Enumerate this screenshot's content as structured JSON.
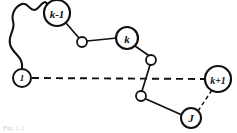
{
  "figure": {
    "caption": "Fig. 1.1",
    "stroke_color": "#111111",
    "fill_color": "#ffffff",
    "background_color": "#ffffff"
  },
  "nodes": [
    {
      "id": "node-1",
      "label": "1",
      "kind": "labeled",
      "x": 22,
      "y": 78,
      "r": 9,
      "font_size": 9
    },
    {
      "id": "node-k-minus-1",
      "label": "k-1",
      "kind": "labeled",
      "x": 57,
      "y": 13,
      "r": 13,
      "font_size": 11
    },
    {
      "id": "node-small-a",
      "label": "",
      "kind": "plain",
      "x": 82,
      "y": 42,
      "r": 5,
      "font_size": 0
    },
    {
      "id": "node-k",
      "label": "k",
      "kind": "labeled",
      "x": 127,
      "y": 38,
      "r": 11,
      "font_size": 11
    },
    {
      "id": "node-small-b",
      "label": "",
      "kind": "plain",
      "x": 151,
      "y": 60,
      "r": 5,
      "font_size": 0
    },
    {
      "id": "node-small-c",
      "label": "",
      "kind": "plain",
      "x": 141,
      "y": 96,
      "r": 5,
      "font_size": 0
    },
    {
      "id": "node-j",
      "label": "J",
      "kind": "labeled",
      "x": 191,
      "y": 118,
      "r": 10,
      "font_size": 10
    },
    {
      "id": "node-k-plus-1",
      "label": "k+1",
      "kind": "labeled",
      "x": 218,
      "y": 79,
      "r": 13,
      "font_size": 10
    }
  ],
  "edges": [
    {
      "id": "edge-kminus1-smalla",
      "style": "solid",
      "from": "node-k-minus-1",
      "to": "node-small-a",
      "path": "M 66 23 L 79 38"
    },
    {
      "id": "edge-smalla-k",
      "style": "solid",
      "from": "node-small-a",
      "to": "node-k",
      "path": "M 87 41 L 117 38"
    },
    {
      "id": "edge-k-smallb",
      "style": "solid",
      "from": "node-k",
      "to": "node-small-b",
      "path": "M 135 46 L 148 55"
    },
    {
      "id": "edge-smallb-smallc",
      "style": "solid",
      "from": "node-small-b",
      "to": "node-small-c",
      "path": "M 150 65 L 142 91"
    },
    {
      "id": "edge-smallc-j",
      "style": "solid",
      "from": "node-small-c",
      "to": "node-j",
      "path": "M 146 99 L 182 115"
    },
    {
      "id": "edge-1-to-kplus1-dashed",
      "style": "dashed",
      "from": "node-1",
      "to": "node-k-plus-1",
      "path": "M 32 78 L 205 79"
    },
    {
      "id": "edge-j-to-kplus1-dashed",
      "style": "dashed",
      "from": "node-j",
      "to": "node-k-plus-1",
      "path": "M 198 111 L 212 90"
    }
  ],
  "curve": {
    "id": "wavy-curve",
    "style": "solid",
    "description": "squiggly hand-drawn curve from node 1 up and around to node k-1",
    "path": "M 22 69 C 24 56, 12 54, 10 44 C 8 34, 16 30, 13 21 C 11 13, 16 6, 22 4 C 28 2, 29 10, 34 10 C 39 10, 40 3, 45 2 L 48 4"
  }
}
